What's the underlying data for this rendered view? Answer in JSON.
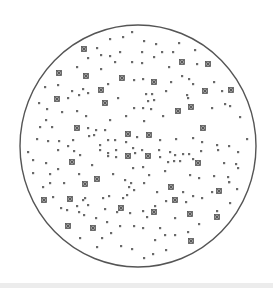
{
  "diagram": {
    "boundary": {
      "shape": "circle",
      "cx": 138,
      "cy": 146,
      "rx": 118,
      "ry": 121,
      "stroke": "#555555",
      "stroke_width": 1.4
    },
    "colors": {
      "dot": "#6a6a6a",
      "large_fill": "#9a9a9a",
      "large_stroke": "#555555",
      "background": "#ffffff"
    },
    "large_particles": [
      [
        84,
        49
      ],
      [
        59,
        73
      ],
      [
        86,
        76
      ],
      [
        122,
        78
      ],
      [
        154,
        82
      ],
      [
        101,
        90
      ],
      [
        57,
        99
      ],
      [
        105,
        103
      ],
      [
        182,
        62
      ],
      [
        208,
        64
      ],
      [
        205,
        91
      ],
      [
        231,
        90
      ],
      [
        191,
        107
      ],
      [
        178,
        111
      ],
      [
        77,
        128
      ],
      [
        128,
        134
      ],
      [
        149,
        135
      ],
      [
        203,
        128
      ],
      [
        72,
        162
      ],
      [
        128,
        156
      ],
      [
        148,
        156
      ],
      [
        198,
        163
      ],
      [
        85,
        184
      ],
      [
        97,
        179
      ],
      [
        171,
        187
      ],
      [
        219,
        191
      ],
      [
        44,
        200
      ],
      [
        70,
        199
      ],
      [
        175,
        200
      ],
      [
        121,
        208
      ],
      [
        154,
        212
      ],
      [
        190,
        214
      ],
      [
        217,
        217
      ],
      [
        68,
        226
      ],
      [
        93,
        228
      ],
      [
        191,
        241
      ]
    ],
    "small_particles": [
      [
        132,
        32
      ],
      [
        123,
        37
      ],
      [
        110,
        39
      ],
      [
        144,
        41
      ],
      [
        156,
        44
      ],
      [
        179,
        43
      ],
      [
        97,
        48
      ],
      [
        195,
        50
      ],
      [
        88,
        58
      ],
      [
        101,
        55
      ],
      [
        110,
        56
      ],
      [
        120,
        52
      ],
      [
        142,
        52
      ],
      [
        154,
        57
      ],
      [
        162,
        52
      ],
      [
        173,
        52
      ],
      [
        115,
        62
      ],
      [
        132,
        62
      ],
      [
        142,
        63
      ],
      [
        169,
        67
      ],
      [
        197,
        64
      ],
      [
        77,
        67
      ],
      [
        101,
        69
      ],
      [
        45,
        87
      ],
      [
        58,
        85
      ],
      [
        72,
        91
      ],
      [
        83,
        89
      ],
      [
        88,
        93
      ],
      [
        79,
        95
      ],
      [
        108,
        84
      ],
      [
        134,
        80
      ],
      [
        143,
        79
      ],
      [
        155,
        81
      ],
      [
        171,
        82
      ],
      [
        182,
        76
      ],
      [
        189,
        79
      ],
      [
        193,
        84
      ],
      [
        214,
        82
      ],
      [
        166,
        91
      ],
      [
        146,
        94
      ],
      [
        152,
        94
      ],
      [
        154,
        100
      ],
      [
        148,
        101
      ],
      [
        118,
        98
      ],
      [
        68,
        98
      ],
      [
        187,
        95
      ],
      [
        222,
        91
      ],
      [
        225,
        104
      ],
      [
        39,
        103
      ],
      [
        47,
        109
      ],
      [
        62,
        112
      ],
      [
        77,
        111
      ],
      [
        86,
        116
      ],
      [
        134,
        108
      ],
      [
        143,
        108
      ],
      [
        151,
        109
      ],
      [
        163,
        116
      ],
      [
        110,
        120
      ],
      [
        126,
        116
      ],
      [
        144,
        121
      ],
      [
        188,
        98
      ],
      [
        212,
        108
      ],
      [
        230,
        106
      ],
      [
        240,
        117
      ],
      [
        46,
        120
      ],
      [
        40,
        127
      ],
      [
        52,
        127
      ],
      [
        88,
        128
      ],
      [
        96,
        130
      ],
      [
        105,
        130
      ],
      [
        89,
        136
      ],
      [
        94,
        135
      ],
      [
        73,
        140
      ],
      [
        59,
        141
      ],
      [
        37,
        139
      ],
      [
        48,
        141
      ],
      [
        58,
        150
      ],
      [
        68,
        146
      ],
      [
        74,
        151
      ],
      [
        80,
        155
      ],
      [
        100,
        145
      ],
      [
        108,
        140
      ],
      [
        115,
        140
      ],
      [
        126,
        142
      ],
      [
        137,
        137
      ],
      [
        160,
        140
      ],
      [
        176,
        139
      ],
      [
        193,
        138
      ],
      [
        202,
        142
      ],
      [
        217,
        145
      ],
      [
        229,
        146
      ],
      [
        247,
        139
      ],
      [
        28,
        152
      ],
      [
        33,
        160
      ],
      [
        46,
        163
      ],
      [
        100,
        150
      ],
      [
        108,
        153
      ],
      [
        116,
        150
      ],
      [
        133,
        148
      ],
      [
        142,
        150
      ],
      [
        159,
        150
      ],
      [
        170,
        152
      ],
      [
        175,
        155
      ],
      [
        183,
        154
      ],
      [
        189,
        154
      ],
      [
        174,
        161
      ],
      [
        180,
        161
      ],
      [
        168,
        162
      ],
      [
        201,
        151
      ],
      [
        218,
        150
      ],
      [
        238,
        152
      ],
      [
        108,
        156
      ],
      [
        116,
        157
      ],
      [
        135,
        153
      ],
      [
        160,
        157
      ],
      [
        193,
        159
      ],
      [
        224,
        163
      ],
      [
        236,
        164
      ],
      [
        33,
        173
      ],
      [
        50,
        174
      ],
      [
        58,
        169
      ],
      [
        79,
        174
      ],
      [
        92,
        165
      ],
      [
        113,
        174
      ],
      [
        133,
        168
      ],
      [
        143,
        167
      ],
      [
        149,
        175
      ],
      [
        165,
        171
      ],
      [
        190,
        175
      ],
      [
        199,
        178
      ],
      [
        214,
        176
      ],
      [
        228,
        177
      ],
      [
        238,
        168
      ],
      [
        43,
        187
      ],
      [
        50,
        183
      ],
      [
        64,
        183
      ],
      [
        85,
        198
      ],
      [
        125,
        180
      ],
      [
        131,
        183
      ],
      [
        144,
        183
      ],
      [
        129,
        187
      ],
      [
        134,
        190
      ],
      [
        127,
        195
      ],
      [
        157,
        192
      ],
      [
        183,
        192
      ],
      [
        193,
        196
      ],
      [
        202,
        198
      ],
      [
        212,
        192
      ],
      [
        229,
        182
      ],
      [
        237,
        189
      ],
      [
        53,
        197
      ],
      [
        61,
        208
      ],
      [
        77,
        206
      ],
      [
        83,
        200
      ],
      [
        88,
        205
      ],
      [
        103,
        198
      ],
      [
        109,
        196
      ],
      [
        123,
        198
      ],
      [
        105,
        209
      ],
      [
        117,
        212
      ],
      [
        130,
        213
      ],
      [
        143,
        211
      ],
      [
        155,
        206
      ],
      [
        166,
        201
      ],
      [
        186,
        202
      ],
      [
        79,
        212
      ],
      [
        84,
        215
      ],
      [
        96,
        218
      ],
      [
        107,
        222
      ],
      [
        147,
        217
      ],
      [
        175,
        218
      ],
      [
        199,
        224
      ],
      [
        217,
        211
      ],
      [
        230,
        203
      ],
      [
        80,
        238
      ],
      [
        102,
        238
      ],
      [
        111,
        233
      ],
      [
        120,
        226
      ],
      [
        134,
        226
      ],
      [
        143,
        228
      ],
      [
        160,
        228
      ],
      [
        165,
        235
      ],
      [
        175,
        235
      ],
      [
        188,
        232
      ],
      [
        97,
        247
      ],
      [
        121,
        246
      ],
      [
        132,
        249
      ],
      [
        155,
        240
      ],
      [
        153,
        254
      ],
      [
        166,
        250
      ],
      [
        144,
        258
      ],
      [
        67,
        210
      ],
      [
        229,
        182
      ]
    ]
  }
}
